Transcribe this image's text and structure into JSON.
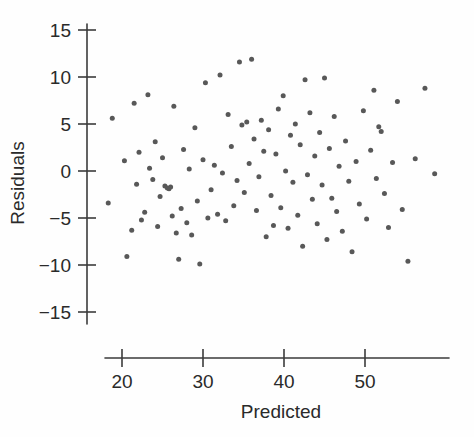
{
  "chart_data": {
    "type": "scatter",
    "title": "",
    "xlabel": "Predicted",
    "ylabel": "Residuals",
    "xlim": [
      16.5,
      60.5
    ],
    "ylim": [
      -17.0,
      16.5
    ],
    "xticks": [
      20,
      30,
      40,
      50
    ],
    "xtick_labels": [
      "20",
      "30",
      "40",
      "50"
    ],
    "yticks": [
      15,
      10,
      5,
      0,
      -5,
      -10,
      -15
    ],
    "ytick_labels": [
      "15",
      "10",
      "5",
      "0",
      "−5",
      "−10",
      "−15"
    ],
    "grid": false,
    "legend": null,
    "marker_color": "#585858",
    "marker_size_px": 5,
    "axis_color": "#3b3b3b",
    "background_color": "#fefefe",
    "n_points": 110,
    "points": [
      [
        18.3,
        -3.4
      ],
      [
        18.8,
        5.6
      ],
      [
        20.3,
        1.1
      ],
      [
        20.6,
        -9.1
      ],
      [
        21.2,
        -6.3
      ],
      [
        21.5,
        7.2
      ],
      [
        21.8,
        -1.4
      ],
      [
        22.1,
        2.0
      ],
      [
        22.4,
        -5.2
      ],
      [
        22.8,
        -4.4
      ],
      [
        23.2,
        8.1
      ],
      [
        23.4,
        0.3
      ],
      [
        23.8,
        -0.9
      ],
      [
        24.1,
        3.1
      ],
      [
        24.4,
        -5.9
      ],
      [
        24.7,
        -2.7
      ],
      [
        25.0,
        1.4
      ],
      [
        25.3,
        -1.6
      ],
      [
        25.6,
        -1.8
      ],
      [
        25.8,
        -1.9
      ],
      [
        26.0,
        -1.7
      ],
      [
        26.2,
        -4.8
      ],
      [
        26.4,
        6.9
      ],
      [
        26.7,
        -6.6
      ],
      [
        27.0,
        -9.4
      ],
      [
        27.3,
        -4.0
      ],
      [
        27.6,
        2.3
      ],
      [
        28.0,
        -5.5
      ],
      [
        28.3,
        0.2
      ],
      [
        28.6,
        -6.8
      ],
      [
        29.0,
        4.6
      ],
      [
        29.3,
        -3.2
      ],
      [
        29.6,
        -9.9
      ],
      [
        30.0,
        1.2
      ],
      [
        30.3,
        9.4
      ],
      [
        30.6,
        -5.0
      ],
      [
        31.0,
        -2.0
      ],
      [
        31.4,
        0.6
      ],
      [
        31.8,
        -4.6
      ],
      [
        32.1,
        10.2
      ],
      [
        32.4,
        -0.2
      ],
      [
        32.8,
        -5.3
      ],
      [
        33.1,
        6.0
      ],
      [
        33.5,
        2.6
      ],
      [
        33.8,
        -3.7
      ],
      [
        34.2,
        -1.0
      ],
      [
        34.5,
        11.6
      ],
      [
        34.8,
        4.9
      ],
      [
        35.1,
        -2.3
      ],
      [
        35.4,
        5.2
      ],
      [
        35.7,
        0.8
      ],
      [
        36.0,
        11.9
      ],
      [
        36.3,
        3.4
      ],
      [
        36.6,
        -4.2
      ],
      [
        36.9,
        -0.6
      ],
      [
        37.2,
        5.4
      ],
      [
        37.5,
        2.1
      ],
      [
        37.8,
        -7.0
      ],
      [
        38.1,
        4.4
      ],
      [
        38.4,
        -2.6
      ],
      [
        38.7,
        -5.8
      ],
      [
        39.0,
        1.8
      ],
      [
        39.3,
        6.6
      ],
      [
        39.6,
        -3.9
      ],
      [
        39.9,
        8.0
      ],
      [
        40.2,
        0.0
      ],
      [
        40.5,
        -6.1
      ],
      [
        40.8,
        3.8
      ],
      [
        41.1,
        -1.2
      ],
      [
        41.4,
        5.0
      ],
      [
        41.7,
        -4.7
      ],
      [
        42.0,
        2.8
      ],
      [
        42.3,
        -8.0
      ],
      [
        42.6,
        9.7
      ],
      [
        42.9,
        -0.4
      ],
      [
        43.2,
        6.2
      ],
      [
        43.5,
        -3.0
      ],
      [
        43.8,
        1.6
      ],
      [
        44.1,
        -5.6
      ],
      [
        44.4,
        4.1
      ],
      [
        44.7,
        -1.5
      ],
      [
        45.0,
        9.9
      ],
      [
        45.3,
        -7.3
      ],
      [
        45.6,
        2.4
      ],
      [
        45.9,
        -2.9
      ],
      [
        46.2,
        5.8
      ],
      [
        46.5,
        -4.3
      ],
      [
        46.8,
        0.5
      ],
      [
        47.2,
        -6.4
      ],
      [
        47.6,
        3.2
      ],
      [
        48.0,
        -1.1
      ],
      [
        48.4,
        -8.6
      ],
      [
        48.9,
        1.0
      ],
      [
        49.3,
        -3.5
      ],
      [
        49.8,
        6.4
      ],
      [
        50.2,
        -5.1
      ],
      [
        50.7,
        2.2
      ],
      [
        51.1,
        8.6
      ],
      [
        51.4,
        -0.8
      ],
      [
        51.7,
        4.7
      ],
      [
        52.0,
        4.2
      ],
      [
        52.4,
        -2.4
      ],
      [
        52.9,
        -6.0
      ],
      [
        53.4,
        0.9
      ],
      [
        54.0,
        7.4
      ],
      [
        54.6,
        -4.1
      ],
      [
        55.3,
        -9.6
      ],
      [
        56.2,
        1.3
      ],
      [
        57.4,
        8.8
      ],
      [
        58.6,
        -0.3
      ]
    ]
  }
}
